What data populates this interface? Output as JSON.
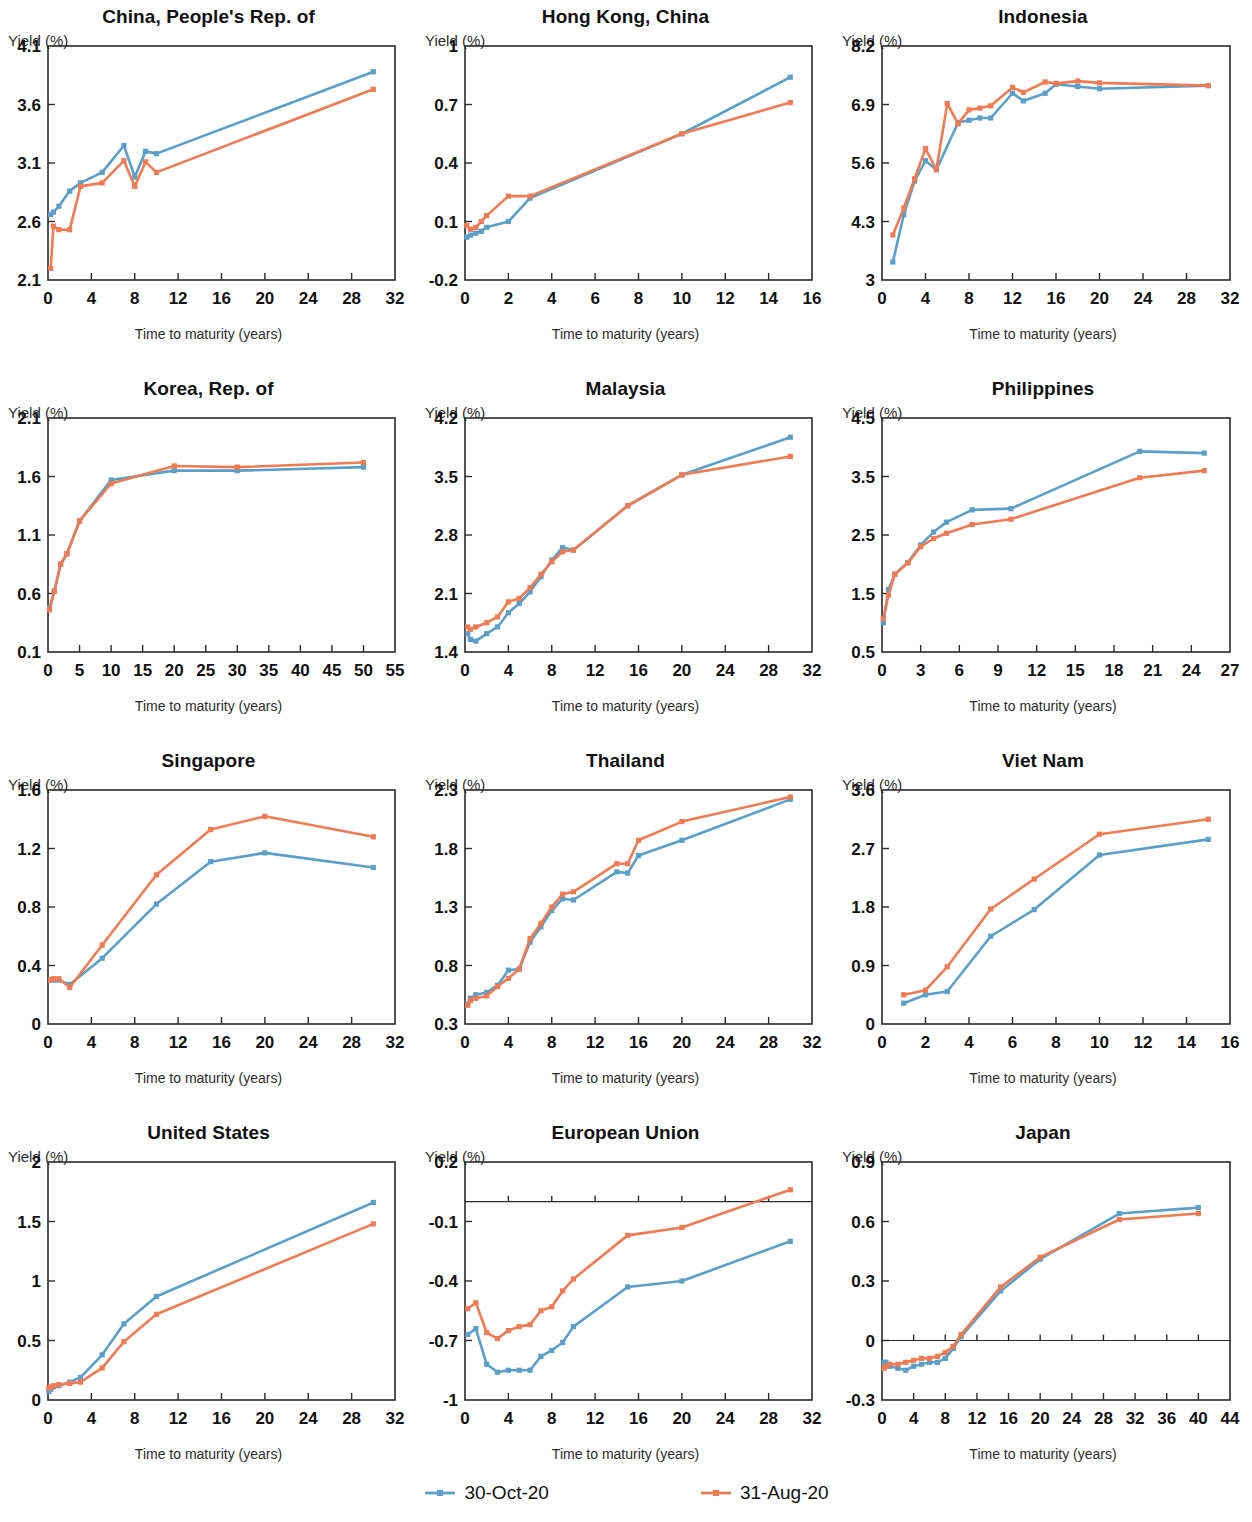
{
  "figure": {
    "xlabel": "Time to maturity (years)",
    "ylabel": "Yield (%)"
  },
  "legend": {
    "items": [
      {
        "label": "30-Oct-20",
        "color": "#5B9FC9",
        "marker": "square"
      },
      {
        "label": "31-Aug-20",
        "color": "#EE7B53",
        "marker": "square"
      }
    ]
  },
  "colors": {
    "series_30oct20": "#5B9FC9",
    "series_31aug20": "#EE7B53",
    "axis": "#2a2a2a",
    "text": "#111111",
    "background": "#ffffff"
  },
  "chart_data": [
    {
      "type": "line",
      "title": "China, People's Rep. of",
      "xlabel": "Time to maturity (years)",
      "ylabel": "Yield (%)",
      "xlim": [
        0,
        32
      ],
      "ylim": [
        2.1,
        4.1
      ],
      "xticks": [
        0,
        4,
        8,
        12,
        16,
        20,
        24,
        28,
        32
      ],
      "yticks": [
        2.1,
        2.6,
        3.1,
        3.6,
        4.1
      ],
      "grid": false,
      "series": [
        {
          "name": "30-Oct-20",
          "color": "#5B9FC9",
          "x": [
            0.25,
            0.5,
            1,
            2,
            3,
            5,
            7,
            8,
            9,
            10,
            30
          ],
          "y": [
            2.66,
            2.68,
            2.73,
            2.86,
            2.93,
            3.02,
            3.25,
            2.98,
            3.2,
            3.18,
            3.88
          ]
        },
        {
          "name": "31-Aug-20",
          "color": "#EE7B53",
          "x": [
            0.25,
            0.5,
            1,
            2,
            3,
            5,
            7,
            8,
            9,
            10,
            30
          ],
          "y": [
            2.2,
            2.56,
            2.53,
            2.53,
            2.9,
            2.93,
            3.12,
            2.9,
            3.11,
            3.02,
            3.73
          ]
        }
      ]
    },
    {
      "type": "line",
      "title": "Hong Kong, China",
      "xlabel": "Time to maturity (years)",
      "ylabel": "Yield (%)",
      "xlim": [
        0,
        16
      ],
      "ylim": [
        -0.2,
        1.0
      ],
      "xticks": [
        0,
        2,
        4,
        6,
        8,
        10,
        12,
        14,
        16
      ],
      "yticks": [
        -0.2,
        0.1,
        0.4,
        0.7,
        1.0
      ],
      "grid": false,
      "series": [
        {
          "name": "30-Oct-20",
          "color": "#5B9FC9",
          "x": [
            0.08,
            0.25,
            0.5,
            0.75,
            1,
            2,
            3,
            10,
            15
          ],
          "y": [
            0.02,
            0.03,
            0.04,
            0.05,
            0.07,
            0.1,
            0.22,
            0.55,
            0.84
          ]
        },
        {
          "name": "31-Aug-20",
          "color": "#EE7B53",
          "x": [
            0.08,
            0.25,
            0.5,
            0.75,
            1,
            2,
            3,
            10,
            15
          ],
          "y": [
            0.08,
            0.06,
            0.07,
            0.1,
            0.13,
            0.23,
            0.23,
            0.55,
            0.71
          ]
        }
      ]
    },
    {
      "type": "line",
      "title": "Indonesia",
      "xlabel": "Time to maturity (years)",
      "ylabel": "Yield (%)",
      "xlim": [
        0,
        32
      ],
      "ylim": [
        3.0,
        8.2
      ],
      "xticks": [
        0,
        4,
        8,
        12,
        16,
        20,
        24,
        28,
        32
      ],
      "yticks": [
        3.0,
        4.3,
        5.6,
        6.9,
        8.2
      ],
      "grid": false,
      "series": [
        {
          "name": "30-Oct-20",
          "color": "#5B9FC9",
          "x": [
            1,
            2,
            3,
            4,
            5,
            7,
            8,
            9,
            10,
            12,
            13,
            15,
            16,
            18,
            20,
            30
          ],
          "y": [
            3.4,
            4.45,
            5.2,
            5.65,
            5.45,
            6.5,
            6.55,
            6.6,
            6.6,
            7.15,
            6.98,
            7.15,
            7.35,
            7.3,
            7.25,
            7.32
          ]
        },
        {
          "name": "31-Aug-20",
          "color": "#EE7B53",
          "x": [
            1,
            2,
            3,
            4,
            5,
            6,
            7,
            8,
            9,
            10,
            12,
            13,
            15,
            16,
            18,
            20,
            30
          ],
          "y": [
            4.0,
            4.6,
            5.25,
            5.92,
            5.45,
            6.92,
            6.47,
            6.78,
            6.82,
            6.87,
            7.28,
            7.17,
            7.4,
            7.37,
            7.42,
            7.38,
            7.32
          ]
        }
      ]
    },
    {
      "type": "line",
      "title": "Korea, Rep. of",
      "xlabel": "Time to maturity (years)",
      "ylabel": "Yield (%)",
      "xlim": [
        0,
        55
      ],
      "ylim": [
        0.1,
        2.1
      ],
      "xticks": [
        0,
        5,
        10,
        15,
        20,
        25,
        30,
        35,
        40,
        45,
        50,
        55
      ],
      "yticks": [
        0.1,
        0.6,
        1.1,
        1.6,
        2.1
      ],
      "grid": false,
      "series": [
        {
          "name": "30-Oct-20",
          "color": "#5B9FC9",
          "x": [
            0.25,
            1,
            2,
            3,
            5,
            10,
            20,
            30,
            50
          ],
          "y": [
            0.48,
            0.62,
            0.85,
            0.94,
            1.22,
            1.57,
            1.65,
            1.65,
            1.68
          ]
        },
        {
          "name": "31-Aug-20",
          "color": "#EE7B53",
          "x": [
            0.25,
            1,
            2,
            3,
            5,
            10,
            20,
            30,
            50
          ],
          "y": [
            0.46,
            0.62,
            0.85,
            0.94,
            1.22,
            1.54,
            1.69,
            1.68,
            1.72
          ]
        }
      ]
    },
    {
      "type": "line",
      "title": "Malaysia",
      "xlabel": "Time to maturity (years)",
      "ylabel": "Yield (%)",
      "xlim": [
        0,
        32
      ],
      "ylim": [
        1.4,
        4.2
      ],
      "xticks": [
        0,
        4,
        8,
        12,
        16,
        20,
        24,
        28,
        32
      ],
      "yticks": [
        1.4,
        2.1,
        2.8,
        3.5,
        4.2
      ],
      "grid": false,
      "series": [
        {
          "name": "30-Oct-20",
          "color": "#5B9FC9",
          "x": [
            0.25,
            0.5,
            1,
            2,
            3,
            4,
            5,
            6,
            7,
            8,
            9,
            10,
            15,
            20,
            30
          ],
          "y": [
            1.62,
            1.55,
            1.53,
            1.62,
            1.7,
            1.87,
            1.98,
            2.12,
            2.3,
            2.5,
            2.65,
            2.62,
            3.15,
            3.52,
            3.97
          ]
        },
        {
          "name": "31-Aug-20",
          "color": "#EE7B53",
          "x": [
            0.25,
            0.5,
            1,
            2,
            3,
            4,
            5,
            6,
            7,
            8,
            9,
            10,
            15,
            20,
            30
          ],
          "y": [
            1.7,
            1.67,
            1.7,
            1.75,
            1.82,
            2.0,
            2.04,
            2.17,
            2.33,
            2.48,
            2.6,
            2.62,
            3.15,
            3.52,
            3.74
          ]
        }
      ]
    },
    {
      "type": "line",
      "title": "Philippines",
      "xlabel": "Time to maturity (years)",
      "ylabel": "Yield (%)",
      "xlim": [
        0,
        27
      ],
      "ylim": [
        0.5,
        4.5
      ],
      "xticks": [
        0,
        3,
        6,
        9,
        12,
        15,
        18,
        21,
        24,
        27
      ],
      "yticks": [
        0.5,
        1.5,
        2.5,
        3.5,
        4.5
      ],
      "grid": false,
      "series": [
        {
          "name": "30-Oct-20",
          "color": "#5B9FC9",
          "x": [
            0.1,
            0.5,
            1,
            2,
            3,
            4,
            5,
            7,
            10,
            20,
            25
          ],
          "y": [
            1.0,
            1.57,
            1.83,
            2.03,
            2.33,
            2.55,
            2.72,
            2.93,
            2.95,
            3.93,
            3.9
          ]
        },
        {
          "name": "31-Aug-20",
          "color": "#EE7B53",
          "x": [
            0.1,
            0.5,
            1,
            2,
            3,
            4,
            5,
            7,
            10,
            20,
            25
          ],
          "y": [
            1.07,
            1.47,
            1.83,
            2.02,
            2.3,
            2.44,
            2.53,
            2.68,
            2.77,
            3.48,
            3.6
          ]
        }
      ]
    },
    {
      "type": "line",
      "title": "Singapore",
      "xlabel": "Time to maturity (years)",
      "ylabel": "Yield (%)",
      "xlim": [
        0,
        32
      ],
      "ylim": [
        0.0,
        1.6
      ],
      "xticks": [
        0,
        4,
        8,
        12,
        16,
        20,
        24,
        28,
        32
      ],
      "yticks": [
        0.0,
        0.4,
        0.8,
        1.2,
        1.6
      ],
      "grid": false,
      "series": [
        {
          "name": "30-Oct-20",
          "color": "#5B9FC9",
          "x": [
            0.25,
            0.5,
            1,
            2,
            5,
            10,
            15,
            20,
            30
          ],
          "y": [
            0.3,
            0.3,
            0.3,
            0.27,
            0.45,
            0.82,
            1.11,
            1.17,
            1.07
          ]
        },
        {
          "name": "31-Aug-20",
          "color": "#EE7B53",
          "x": [
            0.25,
            0.5,
            1,
            2,
            5,
            10,
            15,
            20,
            30
          ],
          "y": [
            0.3,
            0.31,
            0.31,
            0.25,
            0.54,
            1.02,
            1.33,
            1.42,
            1.28
          ]
        }
      ]
    },
    {
      "type": "line",
      "title": "Thailand",
      "xlabel": "Time to maturity (years)",
      "ylabel": "Yield (%)",
      "xlim": [
        0,
        32
      ],
      "ylim": [
        0.3,
        2.3
      ],
      "xticks": [
        0,
        4,
        8,
        12,
        16,
        20,
        24,
        28,
        32
      ],
      "yticks": [
        0.3,
        0.8,
        1.3,
        1.8,
        2.3
      ],
      "grid": false,
      "series": [
        {
          "name": "30-Oct-20",
          "color": "#5B9FC9",
          "x": [
            0.25,
            0.5,
            1,
            2,
            3,
            4,
            5,
            6,
            7,
            8,
            9,
            10,
            14,
            15,
            16,
            20,
            30
          ],
          "y": [
            0.47,
            0.52,
            0.55,
            0.57,
            0.63,
            0.76,
            0.77,
            1.0,
            1.13,
            1.27,
            1.37,
            1.36,
            1.6,
            1.59,
            1.74,
            1.87,
            2.22
          ]
        },
        {
          "name": "31-Aug-20",
          "color": "#EE7B53",
          "x": [
            0.25,
            0.5,
            1,
            2,
            3,
            4,
            5,
            6,
            7,
            8,
            9,
            10,
            14,
            15,
            16,
            20,
            30
          ],
          "y": [
            0.46,
            0.5,
            0.52,
            0.54,
            0.62,
            0.69,
            0.77,
            1.03,
            1.16,
            1.3,
            1.41,
            1.43,
            1.67,
            1.67,
            1.87,
            2.03,
            2.24
          ]
        }
      ]
    },
    {
      "type": "line",
      "title": "Viet Nam",
      "xlabel": "Time to maturity (years)",
      "ylabel": "Yield (%)",
      "xlim": [
        0,
        16
      ],
      "ylim": [
        0.0,
        3.6
      ],
      "xticks": [
        0,
        2,
        4,
        6,
        8,
        10,
        12,
        14,
        16
      ],
      "yticks": [
        0.0,
        0.9,
        1.8,
        2.7,
        3.6
      ],
      "grid": false,
      "series": [
        {
          "name": "30-Oct-20",
          "color": "#5B9FC9",
          "x": [
            1,
            2,
            3,
            5,
            7,
            10,
            15
          ],
          "y": [
            0.32,
            0.45,
            0.5,
            1.35,
            1.76,
            2.6,
            2.84
          ]
        },
        {
          "name": "31-Aug-20",
          "color": "#EE7B53",
          "x": [
            1,
            2,
            3,
            5,
            7,
            10,
            15
          ],
          "y": [
            0.45,
            0.52,
            0.88,
            1.77,
            2.23,
            2.92,
            3.15
          ]
        }
      ]
    },
    {
      "type": "line",
      "title": "United States",
      "xlabel": "Time to maturity (years)",
      "ylabel": "Yield (%)",
      "xlim": [
        0,
        32
      ],
      "ylim": [
        0.0,
        2.0
      ],
      "xticks": [
        0,
        4,
        8,
        12,
        16,
        20,
        24,
        28,
        32
      ],
      "yticks": [
        0.0,
        0.5,
        1.0,
        1.5,
        2.0
      ],
      "grid": false,
      "series": [
        {
          "name": "30-Oct-20",
          "color": "#5B9FC9",
          "x": [
            0.08,
            0.25,
            0.5,
            1,
            2,
            3,
            5,
            7,
            10,
            30
          ],
          "y": [
            0.07,
            0.09,
            0.11,
            0.12,
            0.15,
            0.19,
            0.38,
            0.64,
            0.87,
            1.66
          ]
        },
        {
          "name": "31-Aug-20",
          "color": "#EE7B53",
          "x": [
            0.08,
            0.25,
            0.5,
            1,
            2,
            3,
            5,
            7,
            10,
            30
          ],
          "y": [
            0.1,
            0.11,
            0.12,
            0.13,
            0.14,
            0.15,
            0.27,
            0.49,
            0.72,
            1.48
          ]
        }
      ]
    },
    {
      "type": "line",
      "title": "European Union",
      "xlabel": "Time to maturity (years)",
      "ylabel": "Yield (%)",
      "xlim": [
        0,
        32
      ],
      "ylim": [
        -1.0,
        0.2
      ],
      "xticks": [
        0,
        4,
        8,
        12,
        16,
        20,
        24,
        28,
        32
      ],
      "yticks": [
        -1.0,
        -0.7,
        -0.4,
        -0.1,
        0.2
      ],
      "zeroline": 0.0,
      "grid": false,
      "series": [
        {
          "name": "30-Oct-20",
          "color": "#5B9FC9",
          "x": [
            0.25,
            1,
            2,
            3,
            4,
            5,
            6,
            7,
            8,
            9,
            10,
            15,
            20,
            30
          ],
          "y": [
            -0.67,
            -0.64,
            -0.82,
            -0.86,
            -0.85,
            -0.85,
            -0.85,
            -0.78,
            -0.75,
            -0.71,
            -0.63,
            -0.43,
            -0.4,
            -0.2
          ]
        },
        {
          "name": "31-Aug-20",
          "color": "#EE7B53",
          "x": [
            0.25,
            1,
            2,
            3,
            4,
            5,
            6,
            7,
            8,
            9,
            10,
            15,
            20,
            30
          ],
          "y": [
            -0.54,
            -0.51,
            -0.66,
            -0.69,
            -0.65,
            -0.63,
            -0.62,
            -0.55,
            -0.53,
            -0.45,
            -0.39,
            -0.17,
            -0.13,
            0.06
          ]
        }
      ]
    },
    {
      "type": "line",
      "title": "Japan",
      "xlabel": "Time to maturity (years)",
      "ylabel": "Yield (%)",
      "xlim": [
        0,
        44
      ],
      "ylim": [
        -0.3,
        0.9
      ],
      "xticks": [
        0,
        4,
        8,
        12,
        16,
        20,
        24,
        28,
        32,
        36,
        40,
        44
      ],
      "yticks": [
        -0.3,
        0.0,
        0.3,
        0.6,
        0.9
      ],
      "zeroline": 0.0,
      "grid": false,
      "series": [
        {
          "name": "30-Oct-20",
          "color": "#5B9FC9",
          "x": [
            0.25,
            0.5,
            1,
            2,
            3,
            4,
            5,
            6,
            7,
            8,
            9,
            10,
            15,
            20,
            30,
            40
          ],
          "y": [
            -0.11,
            -0.11,
            -0.13,
            -0.14,
            -0.15,
            -0.13,
            -0.12,
            -0.11,
            -0.11,
            -0.09,
            -0.04,
            0.02,
            0.25,
            0.41,
            0.64,
            0.67
          ]
        },
        {
          "name": "31-Aug-20",
          "color": "#EE7B53",
          "x": [
            0.25,
            0.5,
            1,
            2,
            3,
            4,
            5,
            6,
            7,
            8,
            9,
            10,
            15,
            20,
            30,
            40
          ],
          "y": [
            -0.14,
            -0.13,
            -0.12,
            -0.12,
            -0.11,
            -0.1,
            -0.09,
            -0.09,
            -0.08,
            -0.06,
            -0.03,
            0.03,
            0.27,
            0.42,
            0.61,
            0.64
          ]
        }
      ]
    }
  ]
}
